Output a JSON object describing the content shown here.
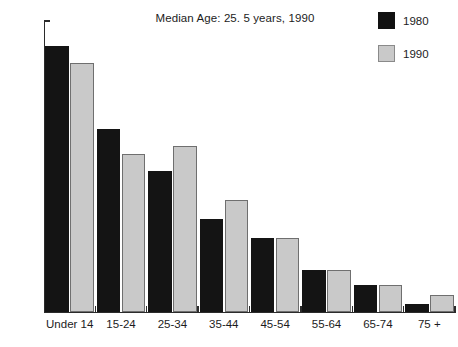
{
  "chart_data": {
    "type": "bar",
    "title": "Median Age: 25. 5 years, 1990",
    "xlabel": "",
    "ylabel": "",
    "ylim": [
      0,
      35
    ],
    "ytick_labels": [
      "0%",
      "5%",
      "10%",
      "15%",
      "20%",
      "25%",
      "30%",
      "35%"
    ],
    "ytick_values": [
      0,
      5,
      10,
      15,
      20,
      25,
      30,
      35
    ],
    "grid": false,
    "legend_position": "top-right",
    "categories": [
      "Under 14",
      "15-24",
      "25-34",
      "35-44",
      "45-54",
      "55-64",
      "65-74",
      "75 +"
    ],
    "series": [
      {
        "name": "1980",
        "color": "#141414",
        "values": [
          32.0,
          22.0,
          17.0,
          11.2,
          8.9,
          5.1,
          3.3,
          1.0
        ]
      },
      {
        "name": "1990",
        "color": "#c9c9c9",
        "values": [
          30.0,
          19.0,
          20.0,
          13.5,
          8.9,
          5.1,
          3.3,
          2.0
        ]
      }
    ]
  },
  "legend": {
    "items": [
      {
        "label": "1980",
        "swatch": "black"
      },
      {
        "label": "1990",
        "swatch": "gray"
      }
    ]
  }
}
